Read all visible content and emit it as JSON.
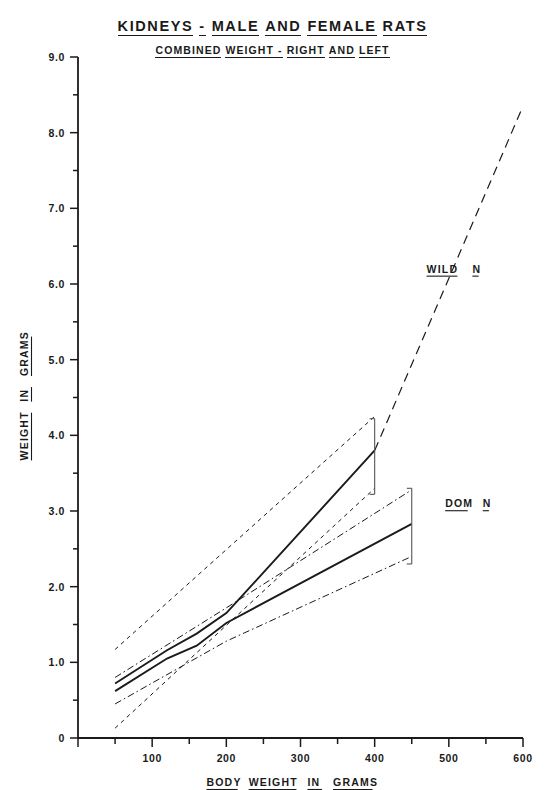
{
  "titles": {
    "main_words": [
      "KIDNEYS",
      "-",
      "MALE",
      "AND",
      "FEMALE",
      "RATS"
    ],
    "sub_words": [
      "COMBINED",
      "WEIGHT -",
      "RIGHT",
      "AND",
      "LEFT"
    ],
    "main": "KIDNEYS - MALE AND FEMALE RATS",
    "sub": "COMBINED WEIGHT - RIGHT AND LEFT"
  },
  "chart_data": {
    "type": "line",
    "subtitle": "COMBINED WEIGHT - RIGHT AND LEFT",
    "xlabel": "BODY WEIGHT IN GRAMS",
    "ylabel": "WEIGHT IN GRAMS",
    "xlim": [
      0,
      600
    ],
    "ylim": [
      0,
      9.0
    ],
    "xticks": [
      0,
      100,
      200,
      300,
      400,
      500,
      600
    ],
    "xtick_labels": [
      "0",
      "100",
      "200",
      "300",
      "400",
      "500",
      "600"
    ],
    "x_minor_step": 50,
    "yticks": [
      0,
      1.0,
      2.0,
      3.0,
      4.0,
      5.0,
      6.0,
      7.0,
      8.0,
      9.0
    ],
    "ytick_labels": [
      "0",
      "1.0",
      "2.0",
      "3.0",
      "4.0",
      "5.0",
      "6.0",
      "7.0",
      "8.0",
      "9.0"
    ],
    "y_minor_step": 0.5,
    "grid": false,
    "legend": "inline-annotations",
    "series": [
      {
        "name": "WILD N",
        "style": "solid-mean",
        "label_x": 470,
        "label_y": 6.15,
        "x": [
          50,
          120,
          160,
          200,
          400
        ],
        "values": [
          0.72,
          1.16,
          1.38,
          1.65,
          3.8
        ]
      },
      {
        "name": "WILD N extrapolation",
        "style": "long-dash",
        "x": [
          400,
          600
        ],
        "values": [
          3.8,
          8.35
        ]
      },
      {
        "name": "WILD N upper limit",
        "style": "short-dash",
        "x": [
          50,
          400
        ],
        "values": [
          1.17,
          4.25
        ]
      },
      {
        "name": "WILD N lower limit",
        "style": "short-dash",
        "x": [
          50,
          400
        ],
        "values": [
          0.13,
          3.3
        ]
      },
      {
        "name": "DOM N",
        "style": "solid-mean",
        "label_x": 495,
        "label_y": 3.05,
        "x": [
          50,
          120,
          160,
          200,
          450
        ],
        "values": [
          0.62,
          1.05,
          1.22,
          1.52,
          2.83
        ]
      },
      {
        "name": "DOM N upper limit",
        "style": "dash-dot",
        "x": [
          50,
          200,
          450
        ],
        "values": [
          0.8,
          1.72,
          3.28
        ]
      },
      {
        "name": "DOM N lower limit",
        "style": "dash-dot",
        "x": [
          50,
          200,
          450
        ],
        "values": [
          0.45,
          1.28,
          2.4
        ]
      }
    ],
    "error_bars": [
      {
        "series": "WILD N",
        "x": 400,
        "low": 3.22,
        "high": 4.22,
        "mean": 3.8
      },
      {
        "series": "DOM N",
        "x": 450,
        "low": 2.3,
        "high": 3.3,
        "mean": 2.83
      }
    ]
  }
}
